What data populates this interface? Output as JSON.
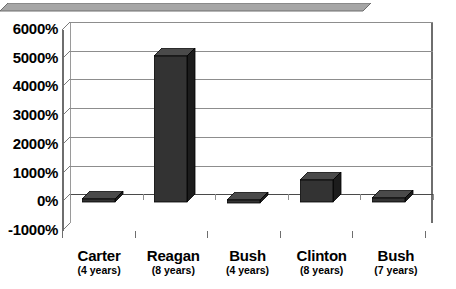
{
  "chart_data": {
    "type": "bar",
    "title": "",
    "subtitle": "",
    "xlabel": "",
    "ylabel": "",
    "categories": [
      "Carter",
      "Reagan",
      "Bush",
      "Clinton",
      "Bush"
    ],
    "category_sublabels": [
      "(4 years)",
      "(8 years)",
      "(4 years)",
      "(8 years)",
      "(7 years)"
    ],
    "values": [
      120,
      5100,
      90,
      760,
      150
    ],
    "value_labels": [
      "120%",
      "5100%",
      "90%",
      "760%",
      "150%"
    ],
    "ylim": [
      -1000,
      6000
    ],
    "ytick_values": [
      6000,
      5000,
      4000,
      3000,
      2000,
      1000,
      0,
      -1000
    ],
    "ytick_labels": [
      "6000%",
      "5000%",
      "4000%",
      "3000%",
      "2000%",
      "1000%",
      "0%",
      "-1000%"
    ],
    "grid": true,
    "legend": "none",
    "style": "3d-column-grayscale",
    "colors": {
      "bar_front": "#333333",
      "bar_top": "#4a4a4a",
      "bar_side": "#1c1c1c",
      "gridline": "#8d8d8d",
      "axis": "#6e6e6e",
      "floor": "#9e9e9e",
      "text": "#000000",
      "background": "#ffffff"
    }
  }
}
